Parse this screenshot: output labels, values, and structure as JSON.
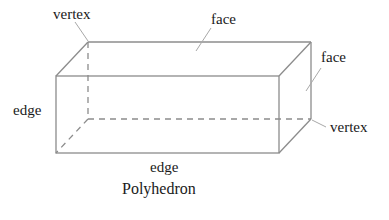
{
  "diagram": {
    "title": "Polyhedron",
    "shape": "rectangular prism",
    "labels": {
      "vertex_top": "vertex",
      "face_top": "face",
      "face_right": "face",
      "edge_left": "edge",
      "vertex_right": "vertex",
      "edge_bottom": "edge"
    },
    "colors": {
      "edges": "#8c8c8c",
      "leaders": "#a8a8a8",
      "text": "#1a1a1a",
      "background": "#ffffff"
    }
  }
}
